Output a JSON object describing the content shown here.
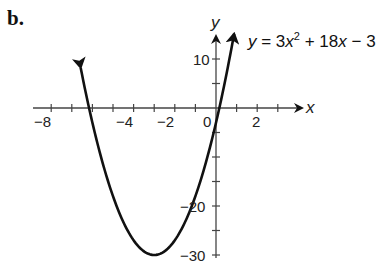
{
  "figure": {
    "part_label": "b.",
    "equation": {
      "lhs": "y",
      "eq": " = 3",
      "x1": "x",
      "exp": "2",
      "mid": " + 18",
      "x2": "x",
      "tail": " − 3"
    }
  },
  "axes": {
    "x_name": "x",
    "y_name": "y",
    "x_tick_labels": [
      "−8",
      "−4",
      "−2",
      "0",
      "2"
    ],
    "y_tick_labels": [
      "10",
      "−20",
      "−30"
    ]
  },
  "chart_data": {
    "type": "line",
    "xlabel": "x",
    "ylabel": "y",
    "xlim": [
      -8.5,
      4
    ],
    "ylim": [
      -31,
      15
    ],
    "x_ticks": [
      -8,
      -7,
      -6,
      -5,
      -4,
      -3,
      -2,
      -1,
      0,
      1,
      2,
      3
    ],
    "x_tick_labels": {
      "-8": "−8",
      "-4": "−4",
      "-2": "−2",
      "0": "0",
      "2": "2"
    },
    "y_ticks": [
      10,
      5,
      -5,
      -10,
      -15,
      -20,
      -25,
      -30
    ],
    "y_tick_labels": {
      "10": "10",
      "-20": "−20",
      "-30": "−30"
    },
    "grid": false,
    "legend": "none",
    "series": [
      {
        "name": "y = 3x^2 + 18x - 3",
        "function": "3*x^2 + 18*x - 3",
        "vertex": [
          -3,
          -30
        ],
        "x": [
          -6.5,
          -6,
          -5,
          -4,
          -3,
          -2,
          -1,
          0,
          0.5
        ],
        "y": [
          14.25,
          -3,
          -18,
          -27,
          -30,
          -27,
          -18,
          -3,
          6.75
        ],
        "arrows_both_ends": true
      }
    ]
  }
}
